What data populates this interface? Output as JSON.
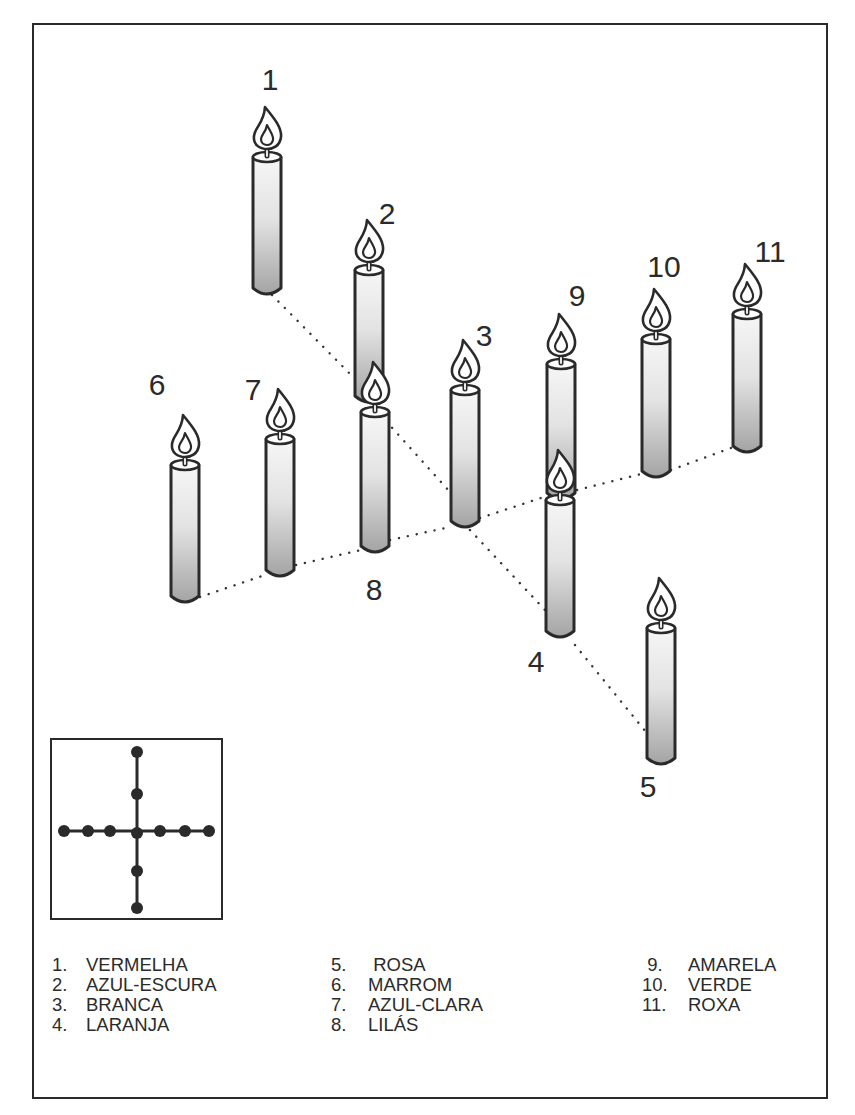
{
  "diagram": {
    "colors": {
      "outline": "#2a2a2a",
      "candle_top": "#f4f4f4",
      "candle_bottom": "#a9a9a9",
      "background": "#ffffff"
    },
    "candles": [
      {
        "id": 1,
        "label": "1",
        "x": 267,
        "top": 157,
        "bottom": 292,
        "label_x": 270,
        "label_y": 90
      },
      {
        "id": 2,
        "label": "2",
        "x": 369,
        "top": 270,
        "bottom": 400,
        "label_x": 387,
        "label_y": 224
      },
      {
        "id": 9,
        "label": "9",
        "x": 561,
        "top": 364,
        "bottom": 497,
        "label_x": 577,
        "label_y": 306
      },
      {
        "id": 10,
        "label": "10",
        "x": 656,
        "top": 339,
        "bottom": 475,
        "label_x": 664,
        "label_y": 277
      },
      {
        "id": 11,
        "label": "11",
        "x": 747,
        "top": 314,
        "bottom": 450,
        "label_x": 770,
        "label_y": 262
      },
      {
        "id": 3,
        "label": "3",
        "x": 465,
        "top": 390,
        "bottom": 525,
        "label_x": 484,
        "label_y": 346
      },
      {
        "id": 8,
        "label": "8",
        "x": 375,
        "top": 412,
        "bottom": 550,
        "label_x": 374,
        "label_y": 600
      },
      {
        "id": 7,
        "label": "7",
        "x": 280,
        "top": 439,
        "bottom": 574,
        "label_x": 253,
        "label_y": 400
      },
      {
        "id": 6,
        "label": "6",
        "x": 185,
        "top": 465,
        "bottom": 600,
        "label_x": 157,
        "label_y": 395
      },
      {
        "id": 4,
        "label": "4",
        "x": 560,
        "top": 500,
        "bottom": 635,
        "label_x": 536,
        "label_y": 672
      },
      {
        "id": 5,
        "label": "5",
        "x": 661,
        "top": 628,
        "bottom": 762,
        "label_x": 648,
        "label_y": 797
      }
    ],
    "dotted_lines": [
      {
        "from": [
          272,
          295
        ],
        "to": [
          360,
          384
        ]
      },
      {
        "from": [
          386,
          421
        ],
        "to": [
          450,
          492
        ]
      },
      {
        "from": [
          470,
          530
        ],
        "to": [
          545,
          610
        ]
      },
      {
        "from": [
          575,
          645
        ],
        "to": [
          646,
          732
        ]
      },
      {
        "from": [
          200,
          597
        ],
        "to": [
          265,
          575
        ]
      },
      {
        "from": [
          296,
          565
        ],
        "to": [
          361,
          550
        ]
      },
      {
        "from": [
          390,
          540
        ],
        "to": [
          450,
          527
        ]
      },
      {
        "from": [
          480,
          518
        ],
        "to": [
          547,
          496
        ]
      },
      {
        "from": [
          577,
          490
        ],
        "to": [
          641,
          474
        ]
      },
      {
        "from": [
          671,
          470
        ],
        "to": [
          731,
          448
        ]
      }
    ],
    "inset": {
      "title": "",
      "vertical_dots": [
        [
          135,
          750
        ],
        [
          135,
          792
        ],
        [
          135,
          831
        ],
        [
          135,
          869
        ],
        [
          135,
          906
        ]
      ],
      "horizontal_dots": [
        [
          62,
          829
        ],
        [
          86,
          829
        ],
        [
          108,
          829
        ],
        [
          158,
          829
        ],
        [
          183,
          829
        ],
        [
          207,
          829
        ]
      ]
    }
  },
  "legend": {
    "columns": [
      {
        "items": [
          {
            "num": "1.",
            "name": "VERMELHA"
          },
          {
            "num": "2.",
            "name": "AZUL-ESCURA"
          },
          {
            "num": "3.",
            "name": "BRANCA"
          },
          {
            "num": "4.",
            "name": "LARANJA"
          }
        ]
      },
      {
        "items": [
          {
            "num": "5.",
            "name": " ROSA"
          },
          {
            "num": "6.",
            "name": "MARROM"
          },
          {
            "num": "7.",
            "name": "AZUL-CLARA"
          },
          {
            "num": "8.",
            "name": "LILÁS"
          }
        ]
      },
      {
        "items": [
          {
            "num": " 9.",
            "name": "AMARELA"
          },
          {
            "num": "10.",
            "name": "VERDE"
          },
          {
            "num": "11.",
            "name": "ROXA"
          }
        ]
      }
    ]
  }
}
